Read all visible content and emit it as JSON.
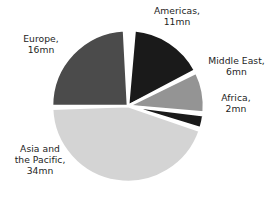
{
  "chart_data": {
    "type": "pie",
    "title": "",
    "subtitle": "",
    "xlabel": "",
    "ylabel": "",
    "grid": false,
    "legend_position": "none",
    "units": "mn",
    "total": 69,
    "categories": [
      "Americas",
      "Middle East",
      "Africa",
      "Asia and the Pacific",
      "Europe"
    ],
    "values": [
      11,
      6,
      2,
      34,
      16
    ],
    "slices": [
      {
        "name": "Americas",
        "label": "Americas,\n11mn",
        "value": 11,
        "value_text": "11mn",
        "color": "#1a1a1a",
        "start_angle": 5,
        "end_angle": 62,
        "label_position": "top-right"
      },
      {
        "name": "Middle East",
        "label": "Middle East,\n6mn",
        "value": 6,
        "value_text": "6mn",
        "color": "#949494",
        "start_angle": 64,
        "end_angle": 95,
        "label_position": "right"
      },
      {
        "name": "Africa",
        "label": "Africa,\n2mn",
        "value": 2,
        "value_text": "2mn",
        "color": "#1a1a1a",
        "start_angle": 97,
        "end_angle": 107,
        "label_position": "right-lower"
      },
      {
        "name": "Asia and the Pacific",
        "label": "Asia and\nthe Pacific,\n34mn",
        "value": 34,
        "value_text": "34mn",
        "color": "#d4d4d4",
        "start_angle": 109,
        "end_angle": 268,
        "label_position": "bottom-left"
      },
      {
        "name": "Europe",
        "label": "Europe,\n16mn",
        "value": 16,
        "value_text": "16mn",
        "color": "#4b4b4b",
        "start_angle": 270,
        "end_angle": 357,
        "label_position": "left"
      }
    ],
    "geometry": {
      "center_x": 128,
      "center_y": 106,
      "radius": 76,
      "separator_color": "#ffffff",
      "separator_width": 2.6,
      "background": "#ffffff"
    }
  }
}
